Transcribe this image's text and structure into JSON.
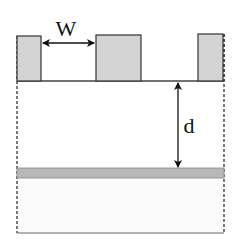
{
  "diagram": {
    "type": "cross-section schematic",
    "labels": {
      "width": "W",
      "depth": "d"
    },
    "colors": {
      "block_fill": "#d4d4d4",
      "band_fill": "#b8b8b8",
      "stroke": "#333333",
      "background": "#ffffff"
    },
    "elements": {
      "blocks": [
        {
          "name": "left-block",
          "x": 16,
          "y": 36,
          "w": 25,
          "h": 45
        },
        {
          "name": "middle-block",
          "x": 96,
          "y": 35,
          "w": 45,
          "h": 46
        },
        {
          "name": "right-block",
          "x": 198,
          "y": 34,
          "w": 24,
          "h": 46
        }
      ],
      "baseline_y": 81,
      "band": {
        "y": 168,
        "h": 10
      },
      "bottom_y": 233,
      "left_edge_x": 17,
      "right_edge_x": 224
    }
  }
}
